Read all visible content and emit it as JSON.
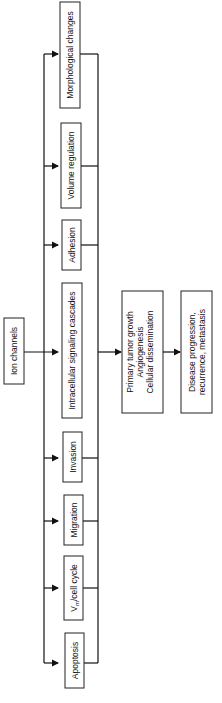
{
  "diagram": {
    "source": {
      "label": "Ion channels"
    },
    "processes": [
      {
        "label": "Morphological changes",
        "y1": 2,
        "y2": 108
      },
      {
        "label": "Volume regulation",
        "y1": 123,
        "y2": 208
      },
      {
        "label": "Adhesion",
        "y1": 220,
        "y2": 270
      },
      {
        "label": "Intracellular signaling cascades",
        "y1": 283,
        "y2": 418
      },
      {
        "label": "Invasion",
        "y1": 432,
        "y2": 482
      },
      {
        "label": "Migration",
        "y1": 495,
        "y2": 545
      },
      {
        "label": "Vm/cell cycle",
        "y1": 556,
        "y2": 620
      },
      {
        "label": "Apoptosis",
        "y1": 633,
        "y2": 688
      }
    ],
    "vm_prefix": "V",
    "vm_subscript": "m",
    "vm_suffix": "/cell cycle",
    "outcome": {
      "lines": [
        "Primary tumor growth",
        "Angiogenesis",
        "Cellular dissemination"
      ]
    },
    "final": {
      "lines": [
        "Disease progression,",
        "recurrence, metastasis"
      ]
    }
  }
}
